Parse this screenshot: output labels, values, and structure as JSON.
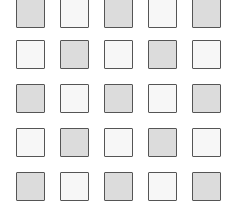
{
  "grid": {
    "rows": 5,
    "cols": 5,
    "colors": {
      "gray": "#dcdcdc",
      "white": "#f7f7f7",
      "border": "#555555"
    },
    "col_x": [
      16,
      60,
      104,
      148,
      192
    ],
    "row_y": [
      -1,
      40,
      84,
      128,
      172
    ],
    "cells": [
      [
        "gray",
        "white",
        "gray",
        "white",
        "gray"
      ],
      [
        "white",
        "gray",
        "white",
        "gray",
        "white"
      ],
      [
        "gray",
        "white",
        "gray",
        "white",
        "gray"
      ],
      [
        "white",
        "gray",
        "white",
        "gray",
        "white"
      ],
      [
        "gray",
        "white",
        "gray",
        "white",
        "gray"
      ]
    ]
  }
}
